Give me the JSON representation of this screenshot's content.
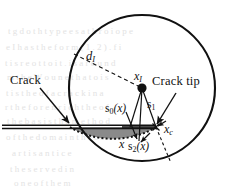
{
  "figure": {
    "caption_absent": true,
    "background_color": "#ffffff",
    "ink_color": "#111111",
    "shaded_region_color": "#8a8a8a"
  },
  "annotations": {
    "crack_label": "Crack",
    "crack_tip_label": "Crack tip"
  },
  "math_labels": {
    "radius": {
      "base": "d",
      "sub": "I"
    },
    "node": {
      "base": "x",
      "sub": "I"
    },
    "crack_tip_point": {
      "base": "x",
      "sub": "c"
    },
    "eval_point": {
      "base": "x",
      "sub": ""
    },
    "s0": {
      "base": "s",
      "sub": "0",
      "arg": "(x)"
    },
    "s1": {
      "base": "s",
      "sub": "1",
      "arg": ""
    },
    "s2": {
      "base": "s",
      "sub": "2",
      "arg": "(x)"
    }
  },
  "geometry": {
    "circle": {
      "cx": 142,
      "cy": 88,
      "r": 73,
      "stroke_width": 2.1
    },
    "node_point": {
      "x": 142,
      "y": 88,
      "radius": 4.6
    },
    "crack_tip_point": {
      "x": 156,
      "y": 127
    },
    "eval_point": {
      "x": 139,
      "y": 142
    },
    "crack_line_y": 127,
    "crack_start_x": 2,
    "shaded_fill": "#8a8a8a",
    "dotted_arc_dash": "2,2.2"
  },
  "background_bleed": [
    {
      "text": "t g d o t h t y p e e s   a t h   r o i o p e",
      "x": 8,
      "y": 30
    },
    {
      "text": "e   I   h a s   t h e   f o r m   ( 1 . 2 ) .   f i",
      "x": 6,
      "y": 46
    },
    {
      "text": "t   i s   r e o t t o   i t .   i s   a r o u n d",
      "x": 5,
      "y": 62
    },
    {
      "text": "m   t h e   W o u n   e   t h a t   o   i s",
      "x": 7,
      "y": 76
    },
    {
      "text": "t   i s   t h e   o f   a   c r a c k   i n   a",
      "x": 6,
      "y": 92
    },
    {
      "text": "r   t h e   f o r   e n r i c h   t h e   o f",
      "x": 5,
      "y": 106
    },
    {
      "text": "t h e   b a s i s   t h e   m e t h o d",
      "x": 7,
      "y": 120
    },
    {
      "text": "o f   t h e   d o m a i n   t h e   c r a c k",
      "x": 6,
      "y": 136
    },
    {
      "text": "a   r   t   i   s   a   n   t   i   c   e",
      "x": 12,
      "y": 152
    },
    {
      "text": "t   h   e   s   e   r   v   e   d   i   n",
      "x": 10,
      "y": 168
    },
    {
      "text": "o   n   e   o   f   t   h   e   m",
      "x": 14,
      "y": 182
    }
  ]
}
